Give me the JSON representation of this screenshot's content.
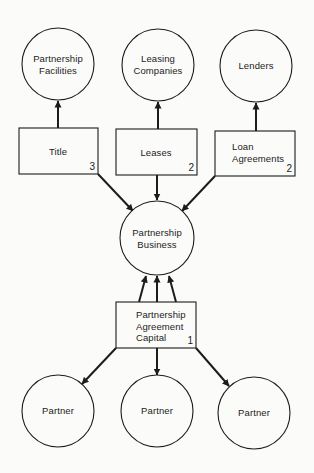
{
  "diagram": {
    "colors": {
      "stroke": "#1c1c1c",
      "background": "#fbfbf9"
    },
    "circles": [
      {
        "id": "partnership-facilities",
        "lines": [
          "Partnership",
          "Facilities"
        ],
        "cx": 58,
        "cy": 64,
        "r": 36
      },
      {
        "id": "leasing-companies",
        "lines": [
          "Leasing",
          "Companies"
        ],
        "cx": 158,
        "cy": 65,
        "r": 36
      },
      {
        "id": "lenders",
        "lines": [
          "Lenders"
        ],
        "cx": 256,
        "cy": 66,
        "r": 36
      },
      {
        "id": "partnership-business",
        "lines": [
          "Partnership",
          "Business"
        ],
        "cx": 157,
        "cy": 238,
        "r": 37
      },
      {
        "id": "partner-1",
        "lines": [
          "Partner"
        ],
        "cx": 58,
        "cy": 411,
        "r": 36
      },
      {
        "id": "partner-2",
        "lines": [
          "Partner"
        ],
        "cx": 157,
        "cy": 411,
        "r": 36
      },
      {
        "id": "partner-3",
        "lines": [
          "Partner"
        ],
        "cx": 254,
        "cy": 413,
        "r": 36
      }
    ],
    "boxes": [
      {
        "id": "title",
        "lines": [
          "Title"
        ],
        "number": "3",
        "x": 19,
        "y": 128,
        "w": 79,
        "h": 46
      },
      {
        "id": "leases",
        "lines": [
          "Leases"
        ],
        "number": "2",
        "x": 116,
        "y": 129,
        "w": 81,
        "h": 46
      },
      {
        "id": "loan-agreements",
        "lines": [
          "Loan",
          "Agreements"
        ],
        "number": "2",
        "x": 215,
        "y": 131,
        "w": 80,
        "h": 45
      },
      {
        "id": "partnership-agreement-capital",
        "lines": [
          "Partnership",
          "Agreement",
          "Capital"
        ],
        "number": "1",
        "x": 116,
        "y": 302,
        "w": 80,
        "h": 46
      }
    ],
    "arrows": [
      {
        "from": "title",
        "to": "partnership-facilities"
      },
      {
        "from": "leases",
        "to": "leasing-companies"
      },
      {
        "from": "loan-agreements",
        "to": "lenders"
      },
      {
        "from": "title",
        "to": "partnership-business"
      },
      {
        "from": "leases",
        "to": "partnership-business"
      },
      {
        "from": "loan-agreements",
        "to": "partnership-business"
      },
      {
        "from": "partnership-agreement-capital",
        "to": "partnership-business",
        "count": 3
      },
      {
        "from": "partnership-agreement-capital",
        "to": "partner-1"
      },
      {
        "from": "partnership-agreement-capital",
        "to": "partner-2"
      },
      {
        "from": "partnership-agreement-capital",
        "to": "partner-3"
      }
    ]
  }
}
